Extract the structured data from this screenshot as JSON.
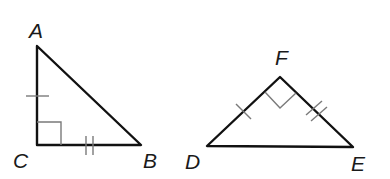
{
  "diagram": {
    "type": "geometry-congruent-right-triangles",
    "triangles": [
      {
        "name": "triangle-ABC",
        "vertices": [
          {
            "label": "A",
            "x": 37,
            "y": 46,
            "label_x": 29,
            "label_y": 38
          },
          {
            "label": "B",
            "x": 141,
            "y": 145,
            "label_x": 143,
            "label_y": 168
          },
          {
            "label": "C",
            "x": 37,
            "y": 145,
            "label_x": 13,
            "label_y": 168
          }
        ],
        "right_angle_at": "C",
        "congruence_marks": [
          {
            "side": "CA",
            "ticks": 1
          },
          {
            "side": "CB",
            "ticks": 2
          }
        ]
      },
      {
        "name": "triangle-DEF",
        "vertices": [
          {
            "label": "D",
            "x": 207,
            "y": 146,
            "label_x": 185,
            "label_y": 169
          },
          {
            "label": "E",
            "x": 353,
            "y": 147,
            "label_x": 351,
            "label_y": 171
          },
          {
            "label": "F",
            "x": 280,
            "y": 77,
            "label_x": 275,
            "label_y": 65
          }
        ],
        "right_angle_at": "F",
        "congruence_marks": [
          {
            "side": "DF",
            "ticks": 1
          },
          {
            "side": "FE",
            "ticks": 2
          }
        ]
      }
    ],
    "colors": {
      "edge": "#111111",
      "mark": "#7a7a7a",
      "label": "#1a1a1a",
      "background": "#ffffff"
    }
  }
}
